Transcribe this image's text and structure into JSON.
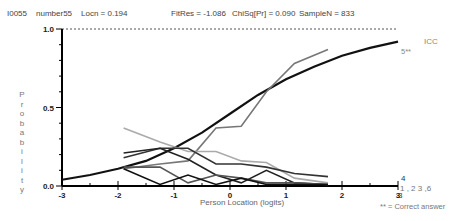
{
  "header": {
    "item_id": "I0055",
    "item_name": "number55",
    "locn": "Locn = 0.194",
    "fitres": "FitRes = -1.086",
    "chisq": "ChiSq[Pr] = 0.090",
    "sample_n": "SampleN = 833"
  },
  "labels": {
    "icc": "ICC",
    "correct_marker": "5**",
    "correct_note": "** = Correct answer",
    "cat_4": "4",
    "cat_3": "3",
    "cat_1": "1",
    "cat_row": "1 , 2  3 ,6",
    "y_letters": [
      "P",
      "r",
      "o",
      "b",
      "a",
      "b",
      "i",
      "l",
      "i",
      "t",
      "y"
    ]
  },
  "colors": {
    "icc_curve": "#111111",
    "distractor_dark": "#333333",
    "distractor_mid": "#555555",
    "correct_option": "#777777",
    "distractor_light": "#aaaaaa",
    "axis": "#000000"
  },
  "chart_data": {
    "type": "line",
    "xlabel": "Person Location (logits)",
    "ylabel": "Probability",
    "xlim": [
      -3,
      3
    ],
    "ylim": [
      0,
      1
    ],
    "x_ticks": [
      "-3",
      "-2",
      "-1",
      "0",
      "1",
      "2",
      "3"
    ],
    "y_ticks": [
      "0.0",
      "0.5",
      "1.0"
    ],
    "reference_line": {
      "y": 1.0,
      "style": "dashed"
    },
    "legend": [
      "ICC",
      "5** (correct)",
      "1",
      "2",
      "3",
      "4",
      "6"
    ],
    "icc_curve": {
      "name": "ICC",
      "x": [
        -3,
        -2.5,
        -2,
        -1.5,
        -1,
        -0.5,
        0,
        0.5,
        1,
        1.5,
        2,
        2.5,
        3
      ],
      "y": [
        0.04,
        0.07,
        0.11,
        0.16,
        0.24,
        0.34,
        0.46,
        0.58,
        0.68,
        0.76,
        0.83,
        0.88,
        0.92
      ]
    },
    "x_group_means": [
      -1.9,
      -1.25,
      -0.75,
      -0.25,
      0.2,
      0.65,
      1.15,
      1.75
    ],
    "series": [
      {
        "name": "5 (correct)",
        "color": "#777777",
        "values": [
          0.11,
          0.14,
          0.16,
          0.37,
          0.38,
          0.6,
          0.78,
          0.87
        ]
      },
      {
        "name": "1",
        "color": "#aaaaaa",
        "values": [
          0.37,
          0.28,
          0.22,
          0.22,
          0.16,
          0.15,
          0.05,
          0.02
        ]
      },
      {
        "name": "2",
        "color": "#333333",
        "values": [
          0.18,
          0.24,
          0.24,
          0.14,
          0.14,
          0.12,
          0.08,
          0.06
        ]
      },
      {
        "name": "3",
        "color": "#222222",
        "values": [
          0.21,
          0.24,
          0.17,
          0.07,
          0.02,
          0.1,
          0.02,
          0.01
        ]
      },
      {
        "name": "4",
        "color": "#555555",
        "values": [
          0.12,
          0.12,
          0.02,
          0.07,
          0.05,
          0.02,
          0.02,
          0.01
        ]
      },
      {
        "name": "6",
        "color": "#111111",
        "values": [
          0.11,
          0.01,
          0.07,
          0.01,
          0.05,
          0.01,
          0.01,
          0.01
        ]
      }
    ],
    "grid": false,
    "legend_position": "right"
  }
}
